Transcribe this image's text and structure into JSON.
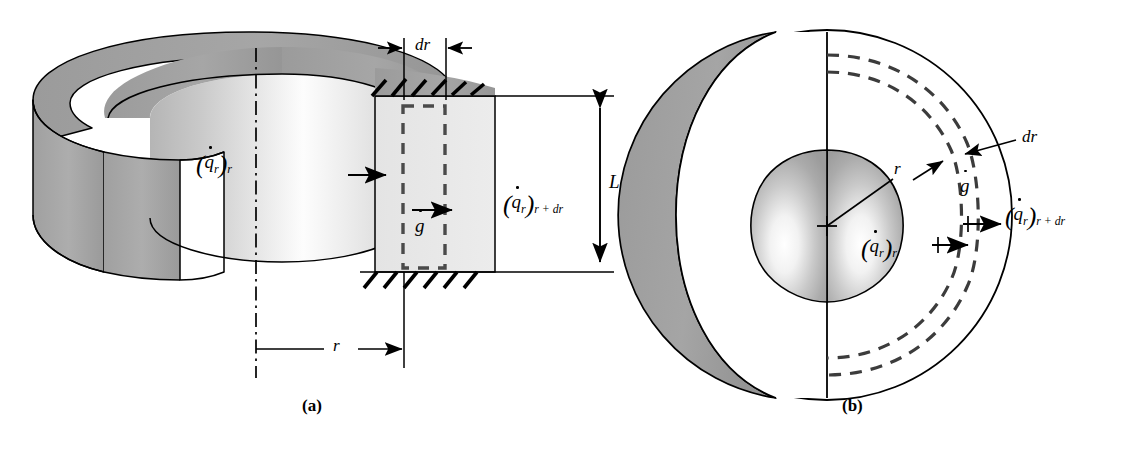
{
  "figure": {
    "background_color": "#ffffff",
    "line_color": "#000000",
    "panels": [
      {
        "id": "a",
        "caption": "(a)",
        "subject": "hollow-cylinder"
      },
      {
        "id": "b",
        "caption": "(b)",
        "subject": "cutaway-sphere"
      }
    ]
  },
  "colors": {
    "outline": "#000000",
    "shell_gray": "#9d9d9d",
    "shell_gray_dark": "#8a8a8a",
    "element_fill": "#e8e8e8",
    "bore_light": "#fdfdfd",
    "bore_mid": "#cfcfcf",
    "core_mid": "#a8a8a8",
    "core_light": "#ffffff",
    "white": "#ffffff"
  },
  "panel_a": {
    "caption": "(a)",
    "labels": {
      "dr": "dr",
      "L": "L",
      "r": "r",
      "gdot_q": "g",
      "q_in_q": "q",
      "q_in_sub1": "r",
      "q_in_sub2": "r",
      "q_out_q": "q",
      "q_out_sub1": "r",
      "q_out_sub2": "r + dr"
    },
    "annotations": {
      "dr_dimension": "dr",
      "length_dimension": "L",
      "radius_dimension": "r",
      "heat_in": "(q̇r)r",
      "heat_out": "(q̇r)r+dr",
      "generation": "ġ"
    }
  },
  "panel_b": {
    "caption": "(b)",
    "labels": {
      "dr": "dr",
      "r": "r",
      "gdot_q": "g",
      "q_in_q": "q",
      "q_in_sub1": "r",
      "q_in_sub2": "r",
      "q_out_q": "q",
      "q_out_sub1": "r",
      "q_out_sub2": "r + dr"
    },
    "annotations": {
      "dr_leader": "dr",
      "radius_arrow": "r",
      "heat_in": "(q̇r)r",
      "heat_out": "(q̇r)r+dr",
      "generation": "ġ",
      "center_mark": "+"
    }
  }
}
